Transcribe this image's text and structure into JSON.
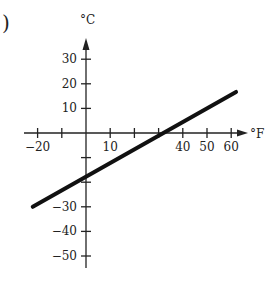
{
  "figure_label": ")",
  "chart_data": {
    "type": "line",
    "title": "",
    "xlabel": "°F",
    "ylabel": "°C",
    "x_ticks": [
      -20,
      -10,
      0,
      10,
      20,
      30,
      40,
      50,
      60
    ],
    "x_tick_labels": [
      {
        "value": -20,
        "label": "−20"
      },
      {
        "value": 10,
        "label": "10"
      },
      {
        "value": 40,
        "label": "40"
      },
      {
        "value": 50,
        "label": "50"
      },
      {
        "value": 60,
        "label": "60"
      }
    ],
    "y_ticks": [
      30,
      20,
      10,
      0,
      -10,
      -20,
      -30,
      -40,
      -50
    ],
    "y_tick_labels": [
      {
        "value": 30,
        "label": "30"
      },
      {
        "value": 20,
        "label": "20"
      },
      {
        "value": 10,
        "label": "10"
      },
      {
        "value": -30,
        "label": "−30"
      },
      {
        "value": -40,
        "label": "−40"
      },
      {
        "value": -50,
        "label": "−50"
      }
    ],
    "xlim": [
      -23,
      67
    ],
    "ylim": [
      -55,
      40
    ],
    "grid": false,
    "legend": null,
    "series": [
      {
        "name": "C = 5/9 (F − 32)",
        "x": [
          -22,
          62
        ],
        "y": [
          -30,
          16.7
        ],
        "color": "#111111"
      }
    ],
    "x_intercept": 32,
    "y_intercept": -17.8
  }
}
